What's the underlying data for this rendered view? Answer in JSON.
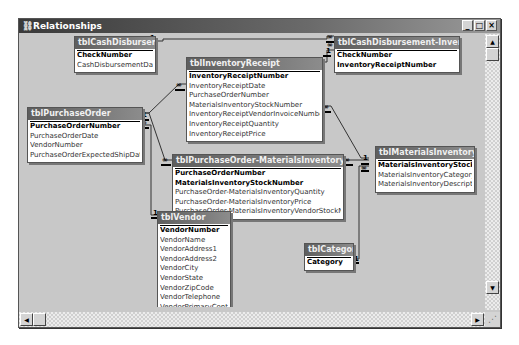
{
  "window": {
    "title": "Relationships",
    "controls": {
      "minimize": "_",
      "maximize": "□",
      "close": "×"
    }
  },
  "tables": {
    "cashDisbursement": {
      "name": "tblCashDisbursement",
      "fields": [
        {
          "name": "CheckNumber",
          "pk": true
        },
        {
          "name": "CashDisbursementDate",
          "pk": false
        }
      ]
    },
    "cashDisbursementInventoryReceipt": {
      "name": "tblCashDisbursement-InventoryRecei...",
      "fields": [
        {
          "name": "CheckNumber",
          "pk": true
        },
        {
          "name": "InventoryReceiptNumber",
          "pk": true
        }
      ]
    },
    "inventoryReceipt": {
      "name": "tblInventoryReceipt",
      "fields": [
        {
          "name": "InventoryReceiptNumber",
          "pk": true
        },
        {
          "name": "InventoryReceiptDate",
          "pk": false
        },
        {
          "name": "PurchaseOrderNumber",
          "pk": false
        },
        {
          "name": "MaterialsInventoryStockNumber",
          "pk": false
        },
        {
          "name": "InventoryReceiptVendorInvoiceNumber",
          "pk": false
        },
        {
          "name": "InventoryReceiptQuantity",
          "pk": false
        },
        {
          "name": "InventoryReceiptPrice",
          "pk": false
        }
      ]
    },
    "purchaseOrder": {
      "name": "tblPurchaseOrder",
      "fields": [
        {
          "name": "PurchaseOrderNumber",
          "pk": true
        },
        {
          "name": "PurchaseOrderDate",
          "pk": false
        },
        {
          "name": "VendorNumber",
          "pk": false
        },
        {
          "name": "PurchaseOrderExpectedShipDate",
          "pk": false
        }
      ]
    },
    "purchaseOrderMaterialsInventory": {
      "name": "tblPurchaseOrder-MaterialsInventory",
      "fields": [
        {
          "name": "PurchaseOrderNumber",
          "pk": true
        },
        {
          "name": "MaterialsInventoryStockNumber",
          "pk": true
        },
        {
          "name": "PurchaseOrder-MaterialsInventoryQuantity",
          "pk": false
        },
        {
          "name": "PurchaseOrder-MaterialsInventoryPrice",
          "pk": false
        },
        {
          "name": "PurchaseOrder-MaterialsInventoryVendorStockNumber",
          "pk": false
        }
      ]
    },
    "materialsInventory": {
      "name": "tblMaterialsInventory",
      "fields": [
        {
          "name": "MaterialsInventoryStockNumber",
          "pk": true
        },
        {
          "name": "MaterialsInventoryCategory",
          "pk": false
        },
        {
          "name": "MaterialsInventoryDescription",
          "pk": false
        }
      ]
    },
    "vendor": {
      "name": "tblVendor",
      "fields": [
        {
          "name": "VendorNumber",
          "pk": true
        },
        {
          "name": "VendorName",
          "pk": false
        },
        {
          "name": "VendorAddress1",
          "pk": false
        },
        {
          "name": "VendorAddress2",
          "pk": false
        },
        {
          "name": "VendorCity",
          "pk": false
        },
        {
          "name": "VendorState",
          "pk": false
        },
        {
          "name": "VendorZipCode",
          "pk": false
        },
        {
          "name": "VendorTelephone",
          "pk": false
        },
        {
          "name": "VendorPrimaryContact",
          "pk": false
        }
      ]
    },
    "category": {
      "name": "tblCategory",
      "fields": [
        {
          "name": "Category",
          "pk": true
        }
      ]
    }
  },
  "relationship_labels": {
    "one": "1",
    "many": "∞"
  },
  "scrollbars": {
    "up": "▲",
    "down": "▼",
    "left": "◀",
    "right": "▶",
    "grip": "⋰"
  }
}
